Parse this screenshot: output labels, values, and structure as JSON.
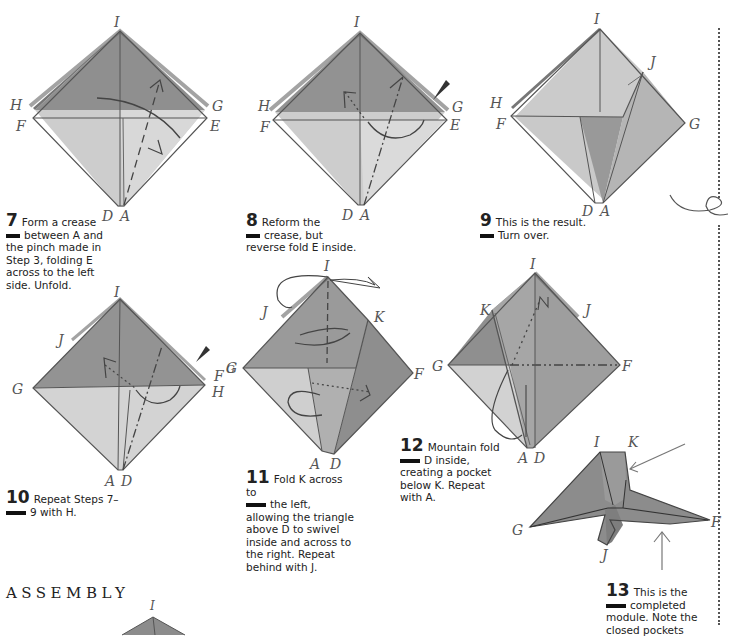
{
  "page": {
    "section_heading": "ASSEMBLY",
    "colors": {
      "paper_dark": "#8f8f8f",
      "paper_mid": "#a8a8a8",
      "paper_light": "#cfcfcf",
      "line": "#555555",
      "text": "#222222"
    }
  },
  "steps": [
    {
      "number": "7",
      "line1": "Form a crease",
      "line2": "between A and",
      "rest": "the pinch made in Step 3, folding E across to the left side. Unfold.",
      "labels": {
        "top": "I",
        "left_upper": "H",
        "left_lower": "F",
        "right_upper": "G",
        "right_lower": "E",
        "bottom_left": "D",
        "bottom_right": "A"
      }
    },
    {
      "number": "8",
      "line1": "Reform the",
      "line2": "crease, but",
      "rest": "reverse fold E inside.",
      "labels": {
        "top": "I",
        "left_upper": "H",
        "left_lower": "F",
        "right_upper": "G",
        "right_lower": "E",
        "bottom_left": "D",
        "bottom_right": "A"
      }
    },
    {
      "number": "9",
      "line1": "This is the result.",
      "line2": "Turn over.",
      "rest": "",
      "labels": {
        "top": "I",
        "right_flap": "J",
        "left_upper": "H",
        "left_lower": "F",
        "right": "G",
        "bottom_left": "D",
        "bottom_right": "A"
      }
    },
    {
      "number": "10",
      "line1": "Repeat Steps 7–",
      "line2": "9 with H.",
      "rest": "",
      "labels": {
        "top": "I",
        "left_flap": "J",
        "left": "G",
        "right_upper": "F",
        "right_upper_small": "G",
        "right": "H",
        "bottom_left": "A",
        "bottom_right": "D"
      }
    },
    {
      "number": "11",
      "line1": "Fold K across to",
      "line2": "the left,",
      "rest": "allowing the triangle above D to swivel inside and across to the right. Repeat behind with J.",
      "labels": {
        "top": "I",
        "left_flap": "J",
        "right_flap": "K",
        "left": "G",
        "right": "F",
        "bottom_left": "A",
        "bottom_right": "D"
      }
    },
    {
      "number": "12",
      "line1": "Mountain fold",
      "line2": "D inside,",
      "rest": "creating a pocket below K. Repeat with A.",
      "labels": {
        "top": "I",
        "left_flap": "K",
        "right_flap": "J",
        "left": "G",
        "right": "F",
        "bottom_left": "A",
        "bottom_right": "D"
      }
    },
    {
      "number": "13",
      "line1": "This is the",
      "line2": "completed",
      "rest": "module. Note the closed pockets",
      "labels": {
        "top": "I",
        "top_right": "K",
        "left": "G",
        "right": "F",
        "bottom": "J"
      }
    }
  ],
  "assembly_diagram": {
    "labels": {
      "top": "I"
    }
  }
}
